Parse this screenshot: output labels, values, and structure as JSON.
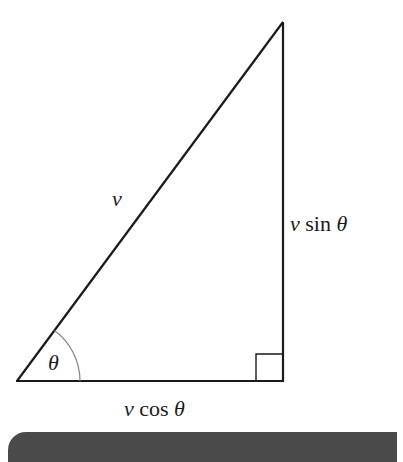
{
  "diagram": {
    "title": "",
    "type": "right-triangle-velocity-decomposition",
    "vertices": {
      "bottom_left": [
        17,
        381
      ],
      "bottom_right": [
        283,
        381
      ],
      "top": [
        283,
        22
      ]
    },
    "labels": {
      "hypotenuse": {
        "var": "v",
        "text": ""
      },
      "vertical_side": {
        "var": "v",
        "func": " sin ",
        "angle": "θ"
      },
      "horizontal_side": {
        "var": "v",
        "func": " cos ",
        "angle": "θ"
      },
      "angle": "θ"
    },
    "right_angle_marker": true,
    "colors": {
      "lines": "#1a1a1a",
      "arc": "#888888",
      "bar": "#4a4a4a"
    }
  }
}
